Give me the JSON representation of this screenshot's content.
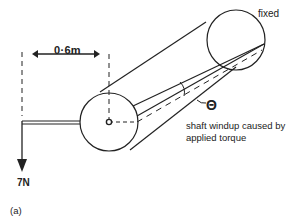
{
  "figure": {
    "label": "(a)",
    "type": "shaft torsion diagram"
  },
  "labels": {
    "dimension": "0·6m",
    "fixed_end": "fixed",
    "angle_symbol": "Θ",
    "caption": "shaft windup caused by applied torque",
    "force": "7N"
  },
  "colors": {
    "line": "#222222",
    "background": "#ffffff"
  }
}
